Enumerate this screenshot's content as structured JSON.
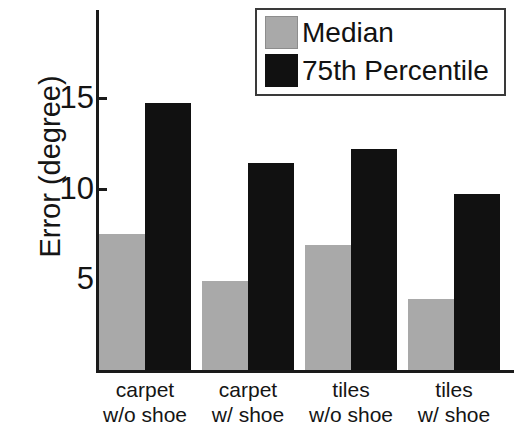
{
  "chart_data": {
    "type": "bar",
    "title": "",
    "xlabel": "",
    "ylabel": "Error (degree)",
    "categories": [
      "carpet w/o shoe",
      "carpet w/ shoe",
      "tiles w/o shoe",
      "tiles w/ shoe"
    ],
    "category_lines": [
      {
        "line1": "carpet",
        "line2": "w/o shoe"
      },
      {
        "line1": "carpet",
        "line2": "w/ shoe"
      },
      {
        "line1": "tiles",
        "line2": "w/o shoe"
      },
      {
        "line1": "tiles",
        "line2": "w/ shoe"
      }
    ],
    "series": [
      {
        "name": "Median",
        "color": "#a9a9a9",
        "values": [
          7.5,
          4.9,
          6.9,
          3.9
        ]
      },
      {
        "name": "75th Percentile",
        "color": "#111111",
        "values": [
          14.7,
          11.4,
          12.2,
          9.7
        ]
      }
    ],
    "ylim": [
      0,
      16.5
    ],
    "yticks": [
      5,
      10,
      15
    ],
    "ytick_labels": [
      "5",
      "10",
      "15"
    ],
    "grid": false,
    "legend_position": "top-right"
  },
  "legend": {
    "entries": [
      {
        "label": "Median",
        "color": "#a9a9a9"
      },
      {
        "label": "75th Percentile",
        "color": "#111111"
      }
    ]
  },
  "axis": {
    "y_title": "Error (degree)"
  }
}
